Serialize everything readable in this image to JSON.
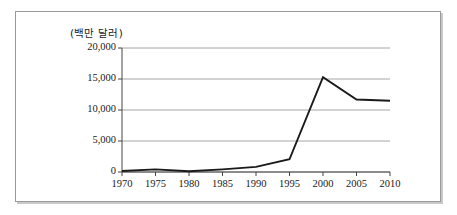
{
  "figure": {
    "axis_title": "(백만 달러)",
    "frame_color": "#9a9a9a",
    "line_color": "#1a1a1a",
    "grid_color": "#a6a6a6"
  },
  "chart_data": {
    "type": "line",
    "title": "",
    "subtitle": "",
    "xlabel": "",
    "ylabel": "(백만 달러)",
    "x": [
      1970,
      1975,
      1980,
      1985,
      1990,
      1995,
      2000,
      2005,
      2010
    ],
    "xtick_labels": [
      "1970",
      "1975",
      "1980",
      "1985",
      "1990",
      "1995",
      "2000",
      "2005",
      "2010"
    ],
    "ytick_labels": [
      "0",
      "5,000",
      "10,000",
      "15,000",
      "20,000"
    ],
    "ytick_values": [
      0,
      5000,
      10000,
      15000,
      20000
    ],
    "xlim": [
      1970,
      2010
    ],
    "ylim": [
      0,
      20000
    ],
    "grid": "horizontal",
    "legend": "none",
    "series": [
      {
        "name": "금액",
        "values": [
          150,
          420,
          120,
          430,
          830,
          2050,
          15300,
          11700,
          11500
        ]
      }
    ]
  }
}
